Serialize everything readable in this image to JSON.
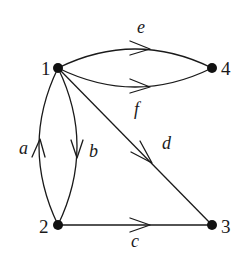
{
  "diagram": {
    "type": "directed multigraph",
    "nodes": [
      {
        "id": "1",
        "label": "1"
      },
      {
        "id": "2",
        "label": "2"
      },
      {
        "id": "3",
        "label": "3"
      },
      {
        "id": "4",
        "label": "4"
      }
    ],
    "edges": [
      {
        "label": "a",
        "from": "2",
        "to": "1"
      },
      {
        "label": "b",
        "from": "1",
        "to": "2"
      },
      {
        "label": "c",
        "from": "2",
        "to": "3"
      },
      {
        "label": "d",
        "from": "1",
        "to": "3"
      },
      {
        "label": "e",
        "from": "1",
        "to": "4"
      },
      {
        "label": "f",
        "from": "1",
        "to": "4"
      }
    ]
  }
}
